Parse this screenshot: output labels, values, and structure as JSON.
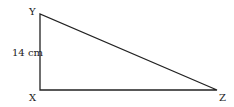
{
  "diagram": {
    "type": "right-triangle",
    "vertices": {
      "Y": {
        "label": "Y",
        "x": 40,
        "y": 14
      },
      "X": {
        "label": "X",
        "x": 40,
        "y": 90
      },
      "Z": {
        "label": "Z",
        "x": 217,
        "y": 90
      }
    },
    "side_label": "14 cm",
    "line_color": "#222222"
  }
}
